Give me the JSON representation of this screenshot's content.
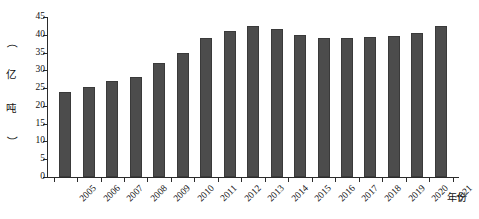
{
  "chart_data": {
    "type": "bar",
    "title": "",
    "subtitle": "",
    "xlabel": "年份",
    "ylabel": "（亿吨）",
    "ylabel_chars": [
      "（",
      "亿",
      "吨",
      "）"
    ],
    "categories": [
      "2005",
      "2006",
      "2007",
      "2008",
      "2009",
      "2010",
      "2011",
      "2012",
      "2013",
      "2014",
      "2015",
      "2016",
      "2017",
      "2018",
      "2019",
      "2020",
      "2021"
    ],
    "values": [
      24.0,
      25.4,
      27.0,
      28.0,
      32.0,
      35.0,
      39.0,
      41.0,
      42.5,
      41.5,
      40.0,
      39.2,
      39.0,
      39.3,
      39.8,
      40.5,
      42.5
    ],
    "ylim": [
      0,
      45
    ],
    "yticks": [
      0,
      5,
      10,
      15,
      20,
      25,
      30,
      35,
      40,
      45
    ],
    "ytick_labels": [
      "0",
      "5",
      "10",
      "15",
      "20",
      "25",
      "30",
      "35",
      "40",
      "45"
    ],
    "grid": false,
    "legend": null,
    "legend_position": "none",
    "bar_color": "#4c4c4c",
    "bar_edge_color": "#3a3a3a",
    "axis_color": "#2b2b2b",
    "background_color": "#ffffff"
  }
}
